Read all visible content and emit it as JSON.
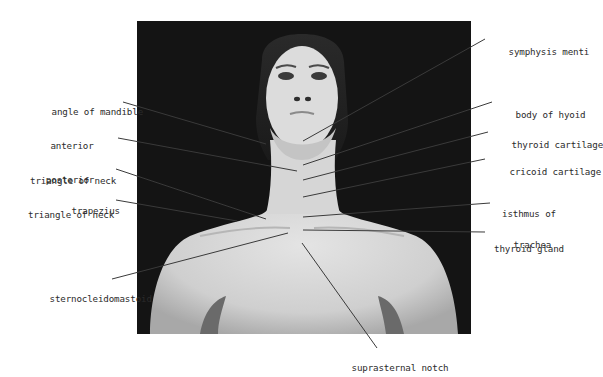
{
  "figure": {
    "background_color": "#141414",
    "skin_color": "#d9d9d9",
    "line_color": "#3a3a3a"
  },
  "labels": {
    "left": [
      {
        "id": "angle-of-mandible",
        "text": "angle of mandible"
      },
      {
        "id": "anterior-triangle",
        "line1": "anterior",
        "line2": "triangle of neck"
      },
      {
        "id": "posterior-triangle",
        "line1": "posterior",
        "line2": "triangle of neck"
      },
      {
        "id": "trapezius",
        "text": "trapezius"
      },
      {
        "id": "sternocleidomastoid",
        "text": "sternocleidomastoid"
      }
    ],
    "right": [
      {
        "id": "symphysis-menti",
        "text": "symphysis menti"
      },
      {
        "id": "body-of-hyoid",
        "text": "body of hyoid"
      },
      {
        "id": "thyroid-cartilage",
        "text": "thyroid cartilage"
      },
      {
        "id": "cricoid-cartilage",
        "text": "cricoid cartilage"
      },
      {
        "id": "isthmus-of-thyroid",
        "line1": "isthmus of",
        "line2": "thyroid gland"
      },
      {
        "id": "trachea",
        "text": "trachea"
      }
    ],
    "bottom": [
      {
        "id": "suprasternal-notch",
        "text": "suprasternal notch"
      }
    ]
  }
}
